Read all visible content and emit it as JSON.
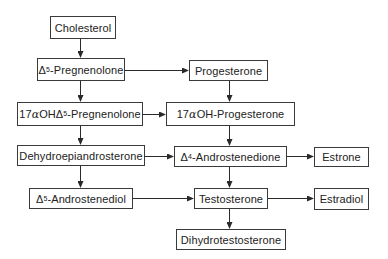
{
  "diagram": {
    "title": "",
    "type": "flowchart",
    "colors": {
      "box_border": "#3a3a3a",
      "text": "#222222",
      "arrow": "#2a2a2a",
      "background": "#ffffff"
    },
    "nodes": [
      {
        "id": "cholesterol",
        "prefix": "",
        "greek": "",
        "mid": "",
        "sup": "",
        "label": "Cholesterol"
      },
      {
        "id": "pregnenolone",
        "prefix": "",
        "greek": "",
        "mid": "Δ",
        "sup": "5",
        "label": "-Pregnenolone"
      },
      {
        "id": "progesterone",
        "prefix": "",
        "greek": "",
        "mid": "",
        "sup": "",
        "label": "Progesterone"
      },
      {
        "id": "oh-pregnenolone",
        "prefix": "17",
        "greek": "α",
        "mid": "OHΔ",
        "sup": "5",
        "label": "-Pregnenolone"
      },
      {
        "id": "oh-progesterone",
        "prefix": "17",
        "greek": "α",
        "mid": "OH-Progesterone",
        "sup": "",
        "label": ""
      },
      {
        "id": "dhea",
        "prefix": "",
        "greek": "",
        "mid": "",
        "sup": "",
        "label": "Dehydroepiandrosterone"
      },
      {
        "id": "androstenedione",
        "prefix": "",
        "greek": "",
        "mid": "Δ",
        "sup": "4",
        "label": "-Androstenedione"
      },
      {
        "id": "estrone",
        "prefix": "",
        "greek": "",
        "mid": "",
        "sup": "",
        "label": "Estrone"
      },
      {
        "id": "androstenediol",
        "prefix": "",
        "greek": "",
        "mid": "Δ",
        "sup": "5",
        "label": "-Androstenediol"
      },
      {
        "id": "testosterone",
        "prefix": "",
        "greek": "",
        "mid": "",
        "sup": "",
        "label": "Testosterone"
      },
      {
        "id": "estradiol",
        "prefix": "",
        "greek": "",
        "mid": "",
        "sup": "",
        "label": "Estradiol"
      },
      {
        "id": "dihydrotestosterone",
        "prefix": "",
        "greek": "",
        "mid": "",
        "sup": "",
        "label": "Dihydrotestosterone"
      }
    ],
    "edges": [
      {
        "from": "cholesterol",
        "to": "pregnenolone"
      },
      {
        "from": "pregnenolone",
        "to": "progesterone"
      },
      {
        "from": "pregnenolone",
        "to": "oh-pregnenolone"
      },
      {
        "from": "progesterone",
        "to": "oh-progesterone"
      },
      {
        "from": "oh-pregnenolone",
        "to": "oh-progesterone"
      },
      {
        "from": "oh-pregnenolone",
        "to": "dhea"
      },
      {
        "from": "oh-progesterone",
        "to": "androstenedione"
      },
      {
        "from": "dhea",
        "to": "androstenedione"
      },
      {
        "from": "dhea",
        "to": "androstenediol"
      },
      {
        "from": "androstenedione",
        "to": "estrone"
      },
      {
        "from": "androstenedione",
        "to": "testosterone"
      },
      {
        "from": "androstenediol",
        "to": "testosterone"
      },
      {
        "from": "testosterone",
        "to": "estradiol"
      },
      {
        "from": "testosterone",
        "to": "dihydrotestosterone"
      }
    ]
  }
}
